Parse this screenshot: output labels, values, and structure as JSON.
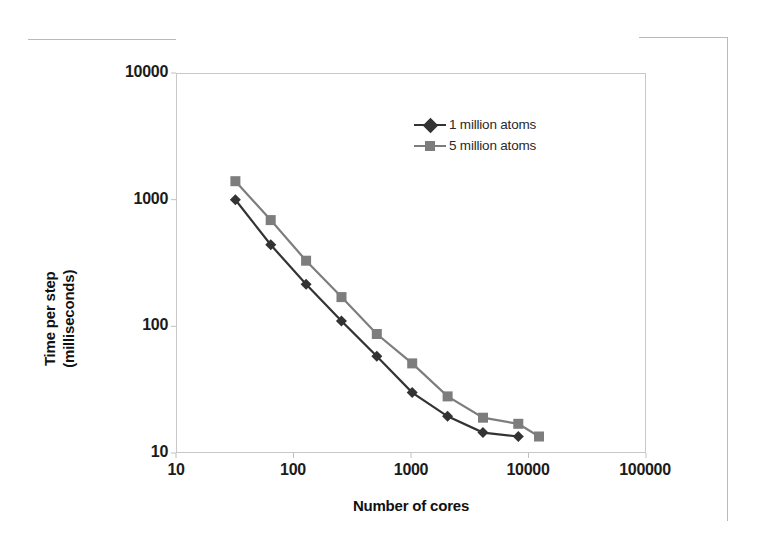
{
  "chart_data": {
    "type": "line",
    "title": "",
    "xlabel": "Number of cores",
    "ylabel": "Time per step (milliseconds)",
    "ylabel_line1": "Time per step",
    "ylabel_line2": "(milliseconds)",
    "xscale": "log",
    "yscale": "log",
    "xlim": [
      10,
      100000
    ],
    "ylim": [
      10,
      10000
    ],
    "grid": false,
    "legend_position": "upper right inside",
    "xticks": [
      "10",
      "100",
      "1000",
      "10000",
      "100000"
    ],
    "xtick_values": [
      10,
      100,
      1000,
      10000,
      100000
    ],
    "yticks": [
      "10",
      "100",
      "1000",
      "10000"
    ],
    "ytick_values": [
      10,
      100,
      1000,
      10000
    ],
    "series": [
      {
        "name": "1 million atoms",
        "color": "#333333",
        "marker": "diamond",
        "x": [
          32,
          64,
          128,
          256,
          512,
          1024,
          2048,
          4096,
          8192
        ],
        "values": [
          1000,
          440,
          215,
          110,
          58,
          30,
          19.5,
          14.5,
          13.5
        ]
      },
      {
        "name": "5 million atoms",
        "color": "#7d7d7d",
        "marker": "square",
        "x": [
          32,
          64,
          128,
          256,
          512,
          1024,
          2048,
          4096,
          8192,
          12288
        ],
        "values": [
          1400,
          690,
          330,
          170,
          87,
          51,
          28,
          19,
          17,
          13.5
        ]
      }
    ]
  },
  "legend": {
    "entries": [
      {
        "label": "1 million atoms",
        "marker": "diamond-marker-icon",
        "color": "#333333"
      },
      {
        "label": "5 million atoms",
        "marker": "square-marker-icon",
        "color": "#7d7d7d"
      }
    ]
  },
  "axes": {
    "x_title": "Number of cores",
    "y_title_line1": "Time per step",
    "y_title_line2": "(milliseconds)",
    "x_tick_labels": [
      "10",
      "100",
      "1000",
      "10000",
      "100000"
    ],
    "y_tick_labels": [
      "10000",
      "1000",
      "100",
      "10"
    ]
  },
  "colors": {
    "series_1": "#333333",
    "series_2": "#7d7d7d",
    "frame": "#c8c8c8",
    "background": "#ffffff",
    "text": "#1b1b1b"
  }
}
